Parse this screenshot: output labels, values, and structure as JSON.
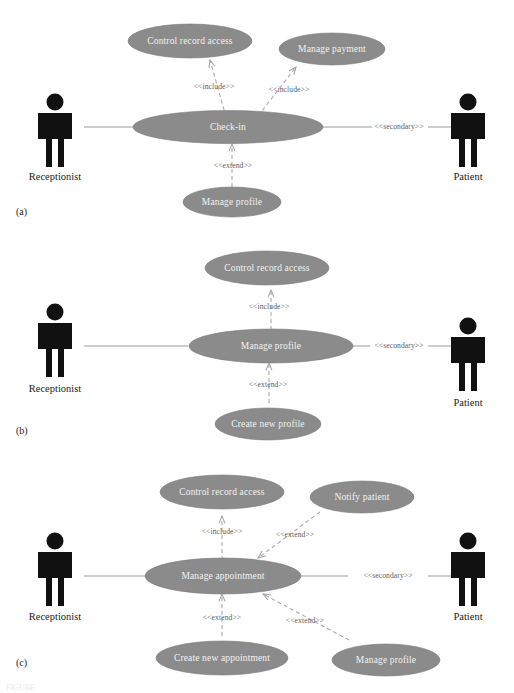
{
  "figure": {
    "background_color": "#ffffff",
    "ellipse_fill": "#8b8b8b",
    "ellipse_text_color": "#f2f2f2",
    "actor_color": "#111111",
    "association_color": "#8e8e8e",
    "dependency_color": "#a9a9a9",
    "ghost_caption": "FIGURE"
  },
  "stereotypes": {
    "include": "<<include>>",
    "extend": "<<extend>>",
    "secondary": "<<secondary>>"
  },
  "actors": {
    "receptionist": "Receptionist",
    "patient": "Patient"
  },
  "panels": [
    {
      "id": "a",
      "label": "(a)",
      "primary_use_case": "Check-in",
      "left_actor": "Receptionist",
      "right_actor": "Patient",
      "right_actor_stereotype": "<<secondary>>",
      "use_cases": [
        {
          "name": "Control record access",
          "relation": "<<include>>",
          "position": "top-left"
        },
        {
          "name": "Manage payment",
          "relation": "<<include>>",
          "position": "top-right"
        },
        {
          "name": "Check-in",
          "relation": "primary",
          "position": "center"
        },
        {
          "name": "Manage profile",
          "relation": "<<extend>>",
          "position": "bottom-center"
        }
      ],
      "relations": [
        {
          "from": "Check-in",
          "to": "Control record access",
          "type": "<<include>>"
        },
        {
          "from": "Check-in",
          "to": "Manage payment",
          "type": "<<include>>"
        },
        {
          "from": "Manage profile",
          "to": "Check-in",
          "type": "<<extend>>"
        },
        {
          "from": "Receptionist",
          "to": "Check-in",
          "type": "association"
        },
        {
          "from": "Check-in",
          "to": "Patient",
          "type": "<<secondary>>"
        }
      ]
    },
    {
      "id": "b",
      "label": "(b)",
      "primary_use_case": "Manage profile",
      "left_actor": "Receptionist",
      "right_actor": "Patient",
      "right_actor_stereotype": "<<secondary>>",
      "use_cases": [
        {
          "name": "Control record access",
          "relation": "<<include>>",
          "position": "top-center"
        },
        {
          "name": "Manage profile",
          "relation": "primary",
          "position": "center"
        },
        {
          "name": "Create new profile",
          "relation": "<<extend>>",
          "position": "bottom-center"
        }
      ],
      "relations": [
        {
          "from": "Manage profile",
          "to": "Control record access",
          "type": "<<include>>"
        },
        {
          "from": "Create new profile",
          "to": "Manage profile",
          "type": "<<extend>>"
        },
        {
          "from": "Receptionist",
          "to": "Manage profile",
          "type": "association"
        },
        {
          "from": "Manage profile",
          "to": "Patient",
          "type": "<<secondary>>"
        }
      ]
    },
    {
      "id": "c",
      "label": "(c)",
      "primary_use_case": "Manage appointment",
      "left_actor": "Receptionist",
      "right_actor": "Patient",
      "right_actor_stereotype": "<<secondary>>",
      "use_cases": [
        {
          "name": "Control record access",
          "relation": "<<include>>",
          "position": "top-left"
        },
        {
          "name": "Notify patient",
          "relation": "<<extend>>",
          "position": "top-right"
        },
        {
          "name": "Manage appointment",
          "relation": "primary",
          "position": "center"
        },
        {
          "name": "Create new appointment",
          "relation": "<<extend>>",
          "position": "bottom-left"
        },
        {
          "name": "Manage profile",
          "relation": "<<extend>>",
          "position": "bottom-right"
        }
      ],
      "relations": [
        {
          "from": "Manage appointment",
          "to": "Control record access",
          "type": "<<include>>"
        },
        {
          "from": "Notify patient",
          "to": "Manage appointment",
          "type": "<<extend>>"
        },
        {
          "from": "Create new appointment",
          "to": "Manage appointment",
          "type": "<<extend>>"
        },
        {
          "from": "Manage profile",
          "to": "Manage appointment",
          "type": "<<extend>>"
        },
        {
          "from": "Receptionist",
          "to": "Manage appointment",
          "type": "association"
        },
        {
          "from": "Manage appointment",
          "to": "Patient",
          "type": "<<secondary>>"
        }
      ]
    }
  ]
}
